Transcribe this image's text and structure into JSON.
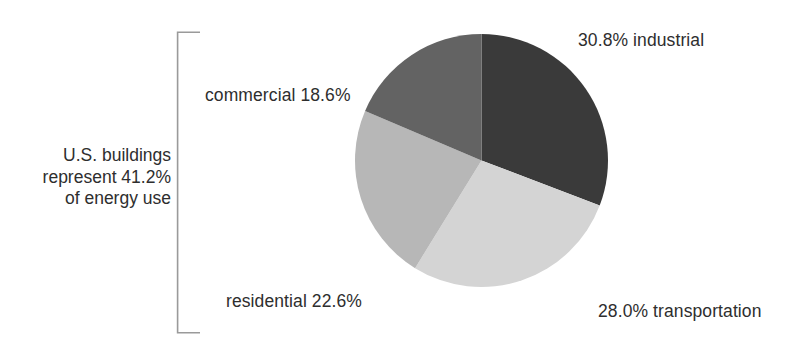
{
  "annotation": {
    "line1": "U.S. buildings",
    "line2": "represent 41.2%",
    "line3": "of energy use"
  },
  "labels": {
    "industrial": "30.8% industrial",
    "commercial": "commercial 18.6%",
    "residential": "residential 22.6%",
    "transportation": "28.0% transportation"
  },
  "colors": {
    "industrial": "#3a3a3a",
    "commercial": "#636363",
    "residential": "#b7b7b7",
    "transportation": "#d4d4d4",
    "text": "#2e2e2e",
    "bracket": "#9a9a9a",
    "background": "#ffffff"
  },
  "chart_data": {
    "type": "pie",
    "title": "",
    "subtitle": "",
    "xlabel": "",
    "ylabel": "",
    "grid": false,
    "legend_position": "none",
    "start_angle_deg": 0,
    "direction": "clockwise",
    "total": 100.0,
    "units": "percent of U.S. energy use",
    "annotation": "U.S. buildings represent 41.2% of energy use",
    "annotation_value": 41.2,
    "annotation_components": [
      "commercial",
      "residential"
    ],
    "categories": [
      "industrial",
      "transportation",
      "residential",
      "commercial"
    ],
    "values": [
      30.8,
      28.0,
      22.6,
      18.6
    ],
    "slices": [
      {
        "name": "industrial",
        "value": 30.8,
        "label": "30.8% industrial",
        "color": "#3a3a3a",
        "start_deg": 0.0,
        "end_deg": 110.88,
        "label_position": "right-top"
      },
      {
        "name": "transportation",
        "value": 28.0,
        "label": "28.0% transportation",
        "color": "#d4d4d4",
        "start_deg": 110.88,
        "end_deg": 211.68,
        "label_position": "right-bottom"
      },
      {
        "name": "residential",
        "value": 22.6,
        "label": "residential 22.6%",
        "color": "#b7b7b7",
        "start_deg": 211.68,
        "end_deg": 293.04,
        "label_position": "left-bottom"
      },
      {
        "name": "commercial",
        "value": 18.6,
        "label": "commercial 18.6%",
        "color": "#636363",
        "start_deg": 293.04,
        "end_deg": 360.0,
        "label_position": "left-top"
      }
    ]
  }
}
